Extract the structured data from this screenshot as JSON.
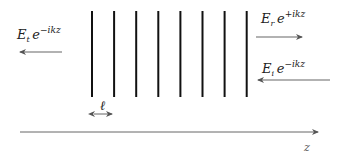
{
  "diagram": {
    "layers": {
      "count": 8,
      "x_start": 92,
      "spacing": 22.1,
      "y_top": 11,
      "y_bottom": 97,
      "color": "#111111"
    },
    "labels": {
      "transmitted": {
        "base": "E",
        "sub": "t",
        "exp_base": "e",
        "exp": "−ikz"
      },
      "reflected": {
        "base": "E",
        "sub": "r",
        "exp_base": "e",
        "exp": "+ikz"
      },
      "incident": {
        "base": "E",
        "sub": "i",
        "exp_base": "e",
        "exp": "−ikz"
      },
      "spacing": "ℓ",
      "axis": "z"
    },
    "arrows": {
      "transmitted_direction": "left",
      "reflected_direction": "right",
      "incident_direction": "left",
      "axis_direction": "right"
    },
    "colors": {
      "arrow": "#666666",
      "layer": "#111111"
    }
  }
}
